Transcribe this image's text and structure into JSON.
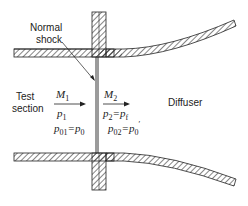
{
  "diagram": {
    "type": "wind-tunnel-normal-shock-schematic",
    "labels": {
      "shock": [
        "Normal",
        "shock"
      ],
      "test_section": [
        "Test",
        "section"
      ],
      "diffuser": "Diffuser"
    },
    "upstream": {
      "mach": "M",
      "mach_sub": "1",
      "pressure": "p",
      "pressure_sub": "1",
      "total_lhs": "p",
      "total_lhs_sub": "01",
      "eq": "=",
      "total_rhs": "p",
      "total_rhs_sub": "0"
    },
    "downstream": {
      "mach": "M",
      "mach_sub": "2",
      "pressure": "p",
      "pressure_sub": "2",
      "eq1": "=",
      "pressure_rhs": "p",
      "pressure_rhs_sub": "f",
      "total_lhs": "p",
      "total_lhs_sub": "02",
      "eq2": "=",
      "total_rhs": "p",
      "total_rhs_sub": "0",
      "prime": "′"
    },
    "colors": {
      "line": "#222222",
      "hatch": "#333333",
      "background": "#ffffff"
    }
  }
}
